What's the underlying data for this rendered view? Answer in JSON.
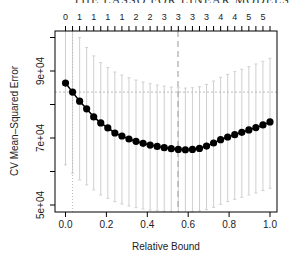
{
  "header": {
    "running_title": "THE LASSO FOR LINEAR MODELS"
  },
  "chart_data": {
    "type": "scatter",
    "title": "",
    "xlabel": "Relative Bound",
    "ylabel": "CV Mean–Squared Error",
    "xlim": [
      0.0,
      1.0
    ],
    "ylim": [
      48000,
      102000
    ],
    "x_ticks": [
      "0.0",
      "0.2",
      "0.4",
      "0.6",
      "0.8",
      "1.0"
    ],
    "x_tick_values": [
      0.0,
      0.2,
      0.4,
      0.6,
      0.8,
      1.0
    ],
    "y_ticks": [
      "5e+04",
      "7e+04",
      "9e+04"
    ],
    "y_tick_values": [
      50000,
      70000,
      90000
    ],
    "y_minor_tick_values": [
      60000,
      80000,
      100000
    ],
    "top_axis_labels": [
      "0",
      "1",
      "1",
      "1",
      "1",
      "2",
      "2",
      "3",
      "3",
      "3",
      "3",
      "4",
      "4",
      "5",
      "5"
    ],
    "x": [
      0.0,
      0.0345,
      0.069,
      0.1034,
      0.1379,
      0.1724,
      0.2069,
      0.2414,
      0.2759,
      0.3103,
      0.3448,
      0.3793,
      0.4138,
      0.4483,
      0.4828,
      0.5172,
      0.5517,
      0.5862,
      0.6207,
      0.6552,
      0.6897,
      0.7241,
      0.7586,
      0.7931,
      0.8276,
      0.8621,
      0.8966,
      0.931,
      0.9655,
      1.0
    ],
    "series": [
      {
        "name": "CV MSE",
        "values": [
          86400,
          83700,
          81000,
          78700,
          76300,
          74500,
          73000,
          71500,
          70600,
          69700,
          69000,
          68400,
          67900,
          67500,
          67100,
          66800,
          66600,
          66500,
          66600,
          66900,
          67600,
          68500,
          69500,
          70300,
          71000,
          71700,
          72400,
          73100,
          73900,
          74800
        ],
        "upper": [
          104000,
          102000,
          100000,
          97000,
          94500,
          92500,
          91000,
          89700,
          88800,
          88000,
          87300,
          86700,
          86200,
          85800,
          85500,
          85200,
          85000,
          84900,
          85000,
          85300,
          86000,
          87000,
          88100,
          89000,
          89800,
          90500,
          91300,
          92100,
          92900,
          93800
        ],
        "lower": [
          62000,
          59500,
          57500,
          56000,
          54500,
          53000,
          52000,
          51000,
          50300,
          49700,
          49200,
          48800,
          48500,
          48300,
          48100,
          48000,
          47900,
          47900,
          48000,
          48200,
          48600,
          49300,
          50200,
          51000,
          51700,
          52300,
          53000,
          53600,
          54300,
          55000
        ]
      }
    ],
    "reference_lines": {
      "horizontal_dotted_y": 83700,
      "vertical_dashed_x": 0.55,
      "vertical_dotted_x": 0.0345
    },
    "grid": false,
    "legend": "none"
  }
}
